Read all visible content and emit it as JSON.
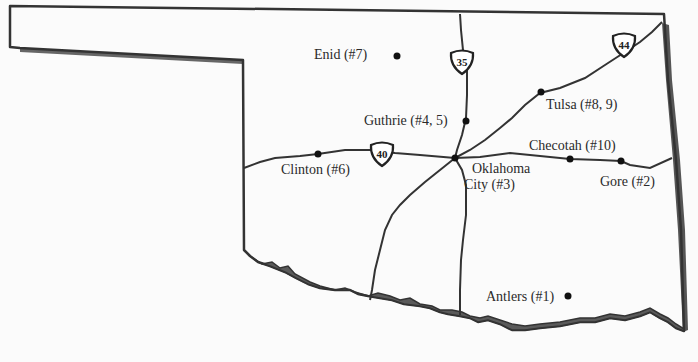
{
  "map": {
    "region": "Oklahoma",
    "colors": {
      "background": "#fbfbfb",
      "outline": "#333333",
      "shadow": "#555555",
      "river": "#5a5a5a",
      "road": "#333333",
      "text": "#2a2a2a"
    }
  },
  "cities": [
    {
      "name": "Enid (#7)",
      "x": 397,
      "y": 56,
      "label_x": 314,
      "label_y": 45
    },
    {
      "name": "Guthrie (#4, 5)",
      "x": 466,
      "y": 121,
      "label_x": 364,
      "label_y": 111
    },
    {
      "name": "Tulsa (#8, 9)",
      "x": 541,
      "y": 92,
      "label_x": 546,
      "label_y": 96
    },
    {
      "name": "Checotah (#10)",
      "x": 570,
      "y": 159,
      "label_x": 529,
      "label_y": 137
    },
    {
      "name": "Gore (#2)",
      "x": 621,
      "y": 161,
      "label_x": 600,
      "label_y": 174
    },
    {
      "name": "Oklahoma City (#3)",
      "line1": "Oklahoma",
      "line2": "City (#3)",
      "x": 454,
      "y": 158,
      "label_x": 472,
      "label_y": 162
    },
    {
      "name": "Clinton (#6)",
      "x": 318,
      "y": 154,
      "label_x": 281,
      "label_y": 161
    },
    {
      "name": "Antlers (#1)",
      "x": 568,
      "y": 296,
      "label_x": 486,
      "label_y": 288
    }
  ],
  "interstates": [
    {
      "number": "35",
      "x": 462,
      "y": 61
    },
    {
      "number": "44",
      "x": 626,
      "y": 46
    },
    {
      "number": "40",
      "x": 382,
      "y": 153
    }
  ]
}
